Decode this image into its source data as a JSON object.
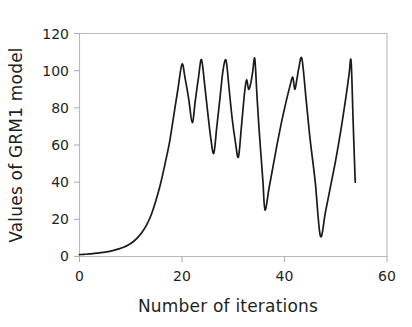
{
  "chart_data": {
    "type": "line",
    "title": "",
    "xlabel": "Number of iterations",
    "ylabel": "Values of GRM1 model",
    "xlim": [
      0,
      60
    ],
    "ylim": [
      0,
      120
    ],
    "xticks": [
      0,
      20,
      40,
      60
    ],
    "yticks": [
      0,
      20,
      40,
      60,
      80,
      100,
      120
    ],
    "xtick_labels": [
      "0",
      "20",
      "40",
      "60"
    ],
    "ytick_labels": [
      "0",
      "20",
      "40",
      "60",
      "80",
      "100",
      "120"
    ],
    "grid": false,
    "legend": null,
    "legend_position": "none",
    "series": [
      {
        "name": "GRM1 model value",
        "color": "#1a1a1a",
        "x": [
          0.0,
          0.6,
          1.2,
          1.9,
          2.6,
          3.4,
          4.2,
          5.0,
          5.9,
          6.8,
          7.7,
          8.6,
          9.5,
          10.4,
          11.3,
          12.2,
          13.1,
          14.0,
          14.9,
          15.8,
          16.7,
          17.6,
          18.4,
          19.2,
          20.0,
          20.6,
          21.3,
          22.0,
          22.6,
          23.2,
          23.8,
          24.4,
          25.0,
          25.6,
          26.2,
          26.8,
          27.4,
          28.0,
          28.6,
          29.2,
          29.8,
          30.4,
          31.0,
          31.6,
          32.2,
          32.6,
          33.0,
          33.4,
          33.8,
          34.2,
          34.6,
          35.0,
          35.4,
          35.8,
          36.2,
          37.0,
          37.8,
          38.6,
          39.4,
          40.2,
          41.0,
          41.6,
          42.0,
          42.4,
          42.8,
          43.4,
          44.2,
          45.0,
          46.0,
          47.0,
          48.0,
          49.0,
          50.0,
          51.0,
          52.0,
          52.6,
          53.0,
          53.4,
          53.8
        ],
        "y": [
          1.0,
          1.1,
          1.2,
          1.4,
          1.6,
          1.8,
          2.1,
          2.4,
          2.8,
          3.4,
          4.1,
          5.0,
          6.2,
          7.8,
          10.0,
          13.0,
          17.0,
          22.5,
          30.0,
          39.0,
          50.0,
          62.0,
          76.0,
          90.0,
          103.5,
          96.0,
          85.0,
          72.0,
          84.0,
          96.0,
          106.0,
          93.0,
          78.0,
          64.0,
          55.5,
          70.0,
          85.0,
          100.0,
          105.5,
          90.0,
          74.0,
          62.0,
          53.5,
          70.0,
          88.0,
          95.0,
          90.0,
          93.0,
          99.5,
          106.5,
          88.0,
          70.0,
          55.0,
          40.0,
          25.0,
          37.0,
          49.0,
          61.0,
          72.0,
          82.0,
          91.0,
          96.5,
          90.0,
          95.0,
          101.5,
          106.5,
          85.0,
          63.0,
          40.0,
          11.0,
          24.0,
          38.0,
          52.0,
          68.0,
          86.0,
          98.0,
          105.0,
          72.0,
          40.0
        ]
      }
    ]
  },
  "axes": {
    "y_title": "Values of GRM1 model",
    "x_title": "Number of iterations",
    "x_tick_0": "0",
    "x_tick_1": "20",
    "x_tick_2": "40",
    "x_tick_3": "60",
    "y_tick_0": "0",
    "y_tick_1": "20",
    "y_tick_2": "40",
    "y_tick_3": "60",
    "y_tick_4": "80",
    "y_tick_5": "100",
    "y_tick_6": "120"
  },
  "style": {
    "curve_color": "#1a1a1a",
    "frame_color": "#b9b9b9",
    "text_color": "#1f1f1f",
    "background": "#ffffff"
  }
}
